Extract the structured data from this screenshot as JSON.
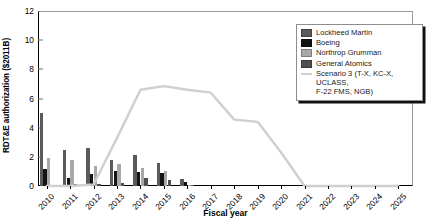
{
  "chart_data": {
    "type": "bar",
    "title": "",
    "xlabel": "Fiscal year",
    "ylabel": "RDT&E authorization ($2011B)",
    "ylim": [
      0,
      12
    ],
    "yticks": [
      0,
      2,
      4,
      6,
      8,
      10,
      12
    ],
    "grid": false,
    "legend_position": "top-right",
    "categories": [
      "2010",
      "2011",
      "2012",
      "2013",
      "2014",
      "2015",
      "2016",
      "2017",
      "2018",
      "2019",
      "2020",
      "2021",
      "2022",
      "2023",
      "2024",
      "2025"
    ],
    "series": [
      {
        "name": "Lockheed Martin",
        "color": "#5a5a5a",
        "values": [
          5.0,
          2.5,
          2.6,
          1.8,
          2.1,
          1.6,
          0.5,
          0,
          0,
          0,
          0,
          0,
          0,
          0,
          0,
          0
        ]
      },
      {
        "name": "Boeing",
        "color": "#141414",
        "values": [
          1.2,
          0.55,
          0.85,
          1.0,
          0.95,
          0.9,
          0.25,
          0,
          0,
          0,
          0,
          0,
          0,
          0,
          0,
          0
        ]
      },
      {
        "name": "Northrop Grumman",
        "color": "#a8a8a8",
        "values": [
          1.9,
          1.75,
          1.35,
          1.5,
          1.25,
          1.05,
          0.1,
          0,
          0,
          0,
          0,
          0,
          0,
          0,
          0,
          0
        ]
      },
      {
        "name": "General Atomics",
        "color": "#4f4f4f",
        "values": [
          0.1,
          0.12,
          0.15,
          0.18,
          0.55,
          0.4,
          0.05,
          0,
          0,
          0,
          0,
          0,
          0,
          0,
          0,
          0
        ]
      }
    ],
    "line_series": {
      "name": "Scenario 3 (T-X, KC-X, UCLASS,\nF-22 FMS, NGB)",
      "color": "#cfcfcf",
      "values": [
        0,
        0,
        0.1,
        3.3,
        6.6,
        6.85,
        6.6,
        6.4,
        4.55,
        4.4,
        2.3,
        0,
        0,
        0,
        0,
        0
      ]
    }
  },
  "legend": {
    "entries": [
      {
        "label": "Lockheed Martin",
        "swatch": "#5a5a5a"
      },
      {
        "label": "Boeing",
        "swatch": "#141414"
      },
      {
        "label": "Northrop Grumman",
        "swatch": "#a8a8a8"
      },
      {
        "label": "General Atomics",
        "swatch": "#4f4f4f"
      },
      {
        "label": "Scenario 3 (T-X, KC-X, UCLASS,\nF-22 FMS, NGB)",
        "swatch": "#cfcfcf"
      }
    ]
  }
}
